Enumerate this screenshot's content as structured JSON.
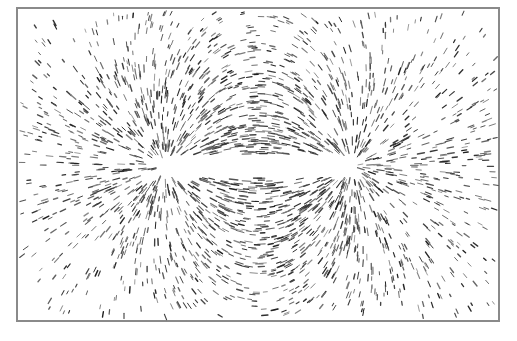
{
  "image": {
    "description": "Iron filings aligned along the magnetic field lines of a bar magnet",
    "subject": "bar magnet",
    "frame_color": "#8a8a8a",
    "filing_color": "#333333",
    "magnet_color": "#ffffff"
  }
}
